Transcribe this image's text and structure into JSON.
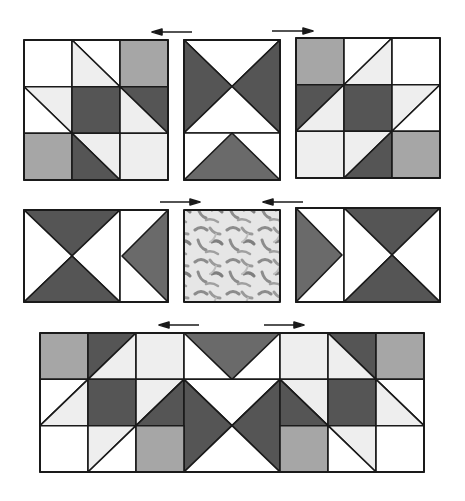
{
  "diagram": {
    "colors": {
      "dark": "#555555",
      "medium": "#a6a6a6",
      "light": "#eeeeee",
      "white": "#ffffff",
      "outline": "#1a1a1a",
      "fabric_base": "#e8e8e8",
      "fabric_motif": "#8a8a8a"
    },
    "rows": [
      {
        "name": "top-row",
        "units": [
          "nine-patch star corner (left)",
          "hourglass with flying geese (center)",
          "nine-patch star corner (right)"
        ],
        "arrows": [
          {
            "direction": "left",
            "label": "press-left"
          },
          {
            "direction": "right",
            "label": "press-right"
          }
        ]
      },
      {
        "name": "middle-row",
        "units": [
          "hourglass with side triangle (left)",
          "printed fabric center square",
          "hourglass with side triangle (right)"
        ],
        "arrows": [
          {
            "direction": "right",
            "label": "press-toward-center"
          },
          {
            "direction": "left",
            "label": "press-toward-center"
          }
        ]
      },
      {
        "name": "bottom-row",
        "units": [
          "assembled strip"
        ],
        "arrows": [
          {
            "direction": "left",
            "label": "press-left"
          },
          {
            "direction": "right",
            "label": "press-right"
          }
        ]
      }
    ]
  }
}
